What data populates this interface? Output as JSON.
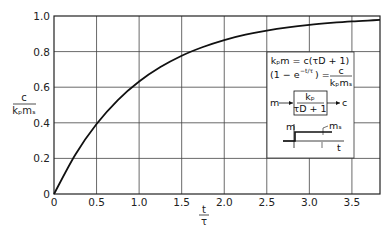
{
  "chart_data": {
    "type": "line",
    "title": "",
    "xlabel_num": "t",
    "xlabel_den": "τ",
    "ylabel_num": "c",
    "ylabel_den": "kₚmₛ",
    "xlim": [
      0,
      3.83
    ],
    "ylim": [
      0,
      1.0
    ],
    "grid": true,
    "xticks": [
      0,
      0.5,
      1.0,
      1.5,
      2.0,
      2.5,
      3.0,
      3.5
    ],
    "xtick_labels": [
      "0",
      "0.5",
      "1.0",
      "1.5",
      "2.0",
      "2.5",
      "3.0",
      "3.5"
    ],
    "yticks": [
      0,
      0.2,
      0.4,
      0.6,
      0.8,
      1.0
    ],
    "ytick_labels": [
      "0",
      "0.2",
      "0.4",
      "0.6",
      "0.8",
      "1.0"
    ],
    "series": [
      {
        "name": "first-order step response 1 - e^(-t/τ)",
        "x": [
          0,
          0.25,
          0.5,
          0.75,
          1.0,
          1.25,
          1.5,
          1.75,
          2.0,
          2.25,
          2.5,
          2.75,
          3.0,
          3.25,
          3.5,
          3.75,
          3.83
        ],
        "y": [
          0,
          0.221,
          0.393,
          0.528,
          0.632,
          0.713,
          0.777,
          0.826,
          0.865,
          0.895,
          0.918,
          0.936,
          0.95,
          0.961,
          0.97,
          0.976,
          0.978
        ]
      }
    ],
    "annotations": {
      "eq1": "kₚm = c(τD + 1)",
      "eq2_left": "(1 − e",
      "eq2_exp": "−t/τ",
      "eq2_right": ") =",
      "eq2_frac_num": "c",
      "eq2_frac_den": "kₚmₛ",
      "block_input": "m",
      "block_num": "kₚ",
      "block_den": "τD + 1",
      "block_output": "c",
      "step_ylabel": "m",
      "step_level_label": "mₛ",
      "step_xlabel": "t"
    }
  }
}
